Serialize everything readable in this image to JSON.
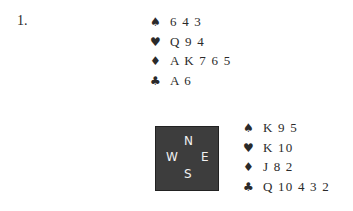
{
  "problem_number": "1.",
  "suit_symbols": {
    "spades": "♠",
    "hearts": "♥",
    "diamonds": "♦",
    "clubs": "♣"
  },
  "north": {
    "spades": "6 4 3",
    "hearts": "Q 9 4",
    "diamonds": "A K 7 6 5",
    "clubs": "A 6"
  },
  "east": {
    "spades": "K 9 5",
    "hearts": "K 10",
    "diamonds": "J 8 2",
    "clubs": "Q 10 4 3 2"
  },
  "compass": {
    "n": "N",
    "w": "W",
    "e": "E",
    "s": "S"
  }
}
